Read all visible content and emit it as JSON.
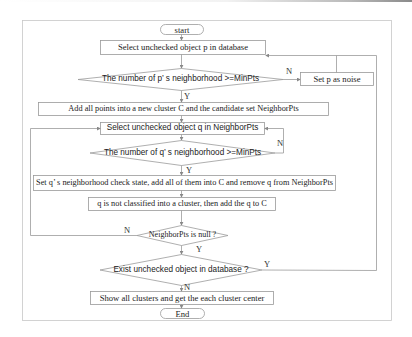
{
  "diagram": {
    "type": "flowchart",
    "nodes": {
      "start": {
        "shape": "terminator",
        "label": "start"
      },
      "select_p": {
        "shape": "process",
        "label": "Select unchecked object p in database"
      },
      "check_p": {
        "shape": "decision",
        "label": "The number of p’ s neighborhood >=MinPts"
      },
      "noise": {
        "shape": "process",
        "label": "Set p as noise"
      },
      "add_points": {
        "shape": "process",
        "label": "Add all points into a new cluster C and the candidate set NeighborPts"
      },
      "select_q": {
        "shape": "process",
        "label": "Select unchecked object q in NeighborPts"
      },
      "check_q": {
        "shape": "decision",
        "label": "The number of q’ s neighborhood >=MinPts"
      },
      "set_q": {
        "shape": "process",
        "label": "Set q’ s neighborhood check state, add all of them into C and remove q from NeighborPts"
      },
      "add_q": {
        "shape": "process",
        "label": "q is not classified into a cluster, then add the q to C"
      },
      "null_check": {
        "shape": "decision",
        "label": "NeighborPts is null ?"
      },
      "exist_check": {
        "shape": "decision",
        "label": "Exist unchecked object in database ?"
      },
      "show": {
        "shape": "process",
        "label": "Show all clusters and get the each cluster center"
      },
      "end": {
        "shape": "terminator",
        "label": "End"
      }
    },
    "edge_labels": {
      "check_p_no": "N",
      "check_p_yes": "Y",
      "check_q_no": "N",
      "check_q_yes": "Y",
      "null_no": "N",
      "null_yes": "Y",
      "exist_yes": "Y",
      "exist_no": "N"
    },
    "edges": [
      {
        "from": "start",
        "to": "select_p"
      },
      {
        "from": "select_p",
        "to": "check_p"
      },
      {
        "from": "check_p",
        "to": "noise",
        "label": "N"
      },
      {
        "from": "noise",
        "to": "select_p"
      },
      {
        "from": "check_p",
        "to": "add_points",
        "label": "Y"
      },
      {
        "from": "add_points",
        "to": "select_q"
      },
      {
        "from": "select_q",
        "to": "check_q"
      },
      {
        "from": "check_q",
        "to": "select_q",
        "label": "N"
      },
      {
        "from": "check_q",
        "to": "set_q",
        "label": "Y"
      },
      {
        "from": "set_q",
        "to": "add_q"
      },
      {
        "from": "add_q",
        "to": "null_check"
      },
      {
        "from": "null_check",
        "to": "select_q",
        "label": "N"
      },
      {
        "from": "null_check",
        "to": "exist_check",
        "label": "Y"
      },
      {
        "from": "exist_check",
        "to": "select_p",
        "label": "Y"
      },
      {
        "from": "exist_check",
        "to": "show",
        "label": "N"
      },
      {
        "from": "show",
        "to": "end"
      }
    ],
    "colors": {
      "stroke": "#8c8c8c",
      "text": "#222222",
      "background": "#ffffff"
    }
  }
}
